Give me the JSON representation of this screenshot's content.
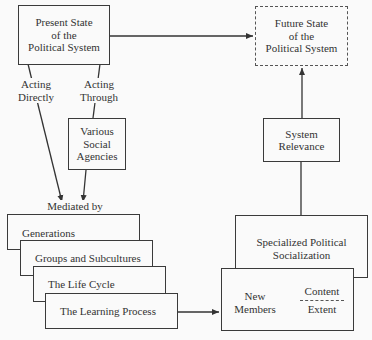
{
  "nodes": {
    "present_state": "Present State\nof the\nPolitical System",
    "future_state": "Future State\nof the\nPolitical System",
    "various_agencies": "Various\nSocial\nAgencies",
    "system_relevance": "System\nRelevance",
    "specialized": "Specialized Political\nSocialization",
    "new_members": "New\nMembers",
    "content": "Content",
    "extent": "Extent",
    "generations": "Generations",
    "groups": "Groups and Subcultures",
    "life_cycle": "The Life Cycle",
    "learning": "The Learning Process"
  },
  "labels": {
    "acting_directly": "Acting\nDirectly",
    "acting_through": "Acting\nThrough",
    "mediated_by": "Mediated by"
  }
}
